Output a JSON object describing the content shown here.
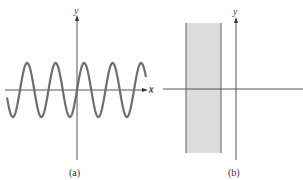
{
  "figure": {
    "panel_a": {
      "caption": "(a)",
      "x_axis_label": "x",
      "y_axis_label": "y",
      "curve": "sine wave",
      "colors": {
        "axis": "#555555",
        "curve": "#707070"
      }
    },
    "panel_b": {
      "caption": "(b)",
      "x_axis_label": "x",
      "y_axis_label": "y",
      "region": "vertical shaded strip left of y-axis",
      "colors": {
        "axis": "#555555",
        "strip_fill": "#d9d9d9",
        "strip_border": "#777777"
      }
    },
    "top_left_fragment": ""
  }
}
